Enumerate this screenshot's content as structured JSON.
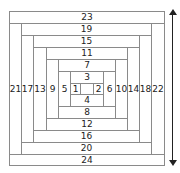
{
  "diagram": {
    "type": "log-cabin-quilt-block",
    "pieces": [
      {
        "label": "",
        "x": 80,
        "y": 83,
        "w": 14,
        "h": 12
      },
      {
        "label": "1",
        "x": 70,
        "y": 83,
        "w": 11,
        "h": 12
      },
      {
        "label": "2",
        "x": 93,
        "y": 83,
        "w": 11,
        "h": 12
      },
      {
        "label": "3",
        "x": 70,
        "y": 71,
        "w": 34,
        "h": 13
      },
      {
        "label": "4",
        "x": 70,
        "y": 94,
        "w": 34,
        "h": 13
      },
      {
        "label": "5",
        "x": 58,
        "y": 71,
        "w": 13,
        "h": 36
      },
      {
        "label": "6",
        "x": 103,
        "y": 71,
        "w": 13,
        "h": 36
      },
      {
        "label": "7",
        "x": 58,
        "y": 59,
        "w": 58,
        "h": 13
      },
      {
        "label": "8",
        "x": 58,
        "y": 106,
        "w": 58,
        "h": 13
      },
      {
        "label": "9",
        "x": 46,
        "y": 59,
        "w": 13,
        "h": 60
      },
      {
        "label": "10",
        "x": 115,
        "y": 59,
        "w": 13,
        "h": 60
      },
      {
        "label": "11",
        "x": 46,
        "y": 47,
        "w": 82,
        "h": 13
      },
      {
        "label": "12",
        "x": 46,
        "y": 118,
        "w": 82,
        "h": 13
      },
      {
        "label": "13",
        "x": 33,
        "y": 47,
        "w": 14,
        "h": 84
      },
      {
        "label": "14",
        "x": 127,
        "y": 47,
        "w": 13,
        "h": 84
      },
      {
        "label": "15",
        "x": 33,
        "y": 35,
        "w": 107,
        "h": 13
      },
      {
        "label": "16",
        "x": 33,
        "y": 130,
        "w": 107,
        "h": 13
      },
      {
        "label": "17",
        "x": 21,
        "y": 35,
        "w": 13,
        "h": 108
      },
      {
        "label": "18",
        "x": 139,
        "y": 35,
        "w": 13,
        "h": 108
      },
      {
        "label": "19",
        "x": 21,
        "y": 23,
        "w": 131,
        "h": 13
      },
      {
        "label": "20",
        "x": 21,
        "y": 142,
        "w": 131,
        "h": 13
      },
      {
        "label": "21",
        "x": 9,
        "y": 23,
        "w": 13,
        "h": 132
      },
      {
        "label": "22",
        "x": 151,
        "y": 23,
        "w": 14,
        "h": 132
      },
      {
        "label": "23",
        "x": 9,
        "y": 11,
        "w": 156,
        "h": 13
      },
      {
        "label": "24",
        "x": 9,
        "y": 154,
        "w": 156,
        "h": 12
      }
    ],
    "arrow": {
      "direction": "double-vertical",
      "color": "#222222"
    },
    "line_color": "#8a8a8a"
  }
}
